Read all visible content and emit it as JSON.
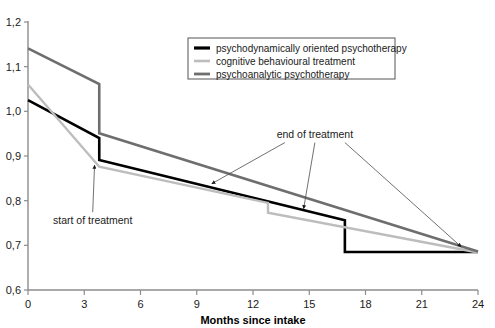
{
  "chart_data": {
    "type": "line",
    "title": "",
    "xlabel": "Months since intake",
    "ylabel": "",
    "xlim": [
      0,
      24
    ],
    "ylim": [
      0.6,
      1.2
    ],
    "grid": false,
    "legend_position": "top-center",
    "xticks": [
      "0",
      "3",
      "6",
      "9",
      "12",
      "15",
      "18",
      "21",
      "24"
    ],
    "xtick_values": [
      0,
      3,
      6,
      9,
      12,
      15,
      18,
      21,
      24
    ],
    "yticks": [
      "0,6",
      "0,7",
      "0,8",
      "0,9",
      "1,0",
      "1,1",
      "1,2"
    ],
    "ytick_values": [
      0.6,
      0.7,
      0.8,
      0.9,
      1.0,
      1.1,
      1.2
    ],
    "series": [
      {
        "name": "psychodynamically oriented psychotherapy",
        "color": "#000000",
        "width": 2.6,
        "points": [
          [
            0,
            1.025
          ],
          [
            3.8,
            0.94
          ],
          [
            3.8,
            0.891
          ],
          [
            16.9,
            0.756
          ],
          [
            16.9,
            0.685
          ],
          [
            24,
            0.685
          ]
        ]
      },
      {
        "name": "cognitive behavioural treatment",
        "color": "#bdbdbd",
        "width": 2.4,
        "points": [
          [
            0,
            1.06
          ],
          [
            3.8,
            0.876
          ],
          [
            12.8,
            0.795
          ],
          [
            12.8,
            0.773
          ],
          [
            24,
            0.684
          ]
        ]
      },
      {
        "name": "psychoanalytic psychotherapy",
        "color": "#6e6e6e",
        "width": 2.6,
        "points": [
          [
            0,
            1.141
          ],
          [
            3.8,
            1.061
          ],
          [
            3.8,
            0.951
          ],
          [
            24,
            0.686
          ]
        ]
      }
    ],
    "annotations": [
      {
        "name": "start-of-treatment",
        "text": "start of treatment",
        "text_x": 3.45,
        "text_y": 0.754,
        "arrow_to_x": 3.55,
        "arrow_to_y": 0.884
      },
      {
        "name": "end-of-treatment",
        "text": "end of treatment",
        "text_x": 15.3,
        "text_y": 0.948,
        "arrow_targets": [
          {
            "x": 9.8,
            "y": 0.838
          },
          {
            "x": 14.7,
            "y": 0.782
          },
          {
            "x": 23.1,
            "y": 0.697
          }
        ]
      }
    ]
  },
  "legend": {
    "items": [
      {
        "label": "psychodynamically oriented psychotherapy",
        "color": "#000000",
        "width": 3.2
      },
      {
        "label": "cognitive behavioural treatment",
        "color": "#bdbdbd",
        "width": 2.6
      },
      {
        "label": "psychoanalytic psychotherapy",
        "color": "#6e6e6e",
        "width": 2.8
      }
    ]
  }
}
